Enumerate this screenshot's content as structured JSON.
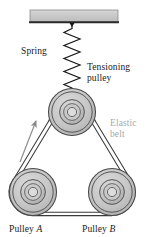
{
  "figure": {
    "background": "#ffffff",
    "width": 148,
    "height": 237
  },
  "labels": {
    "spring": "Spring",
    "tensioning_pulley_line1": "Tensioning",
    "tensioning_pulley_line2": "pulley",
    "elastic_belt_line1": "Elastic",
    "elastic_belt_line2": "belt",
    "pulley_a_word": "Pulley",
    "pulley_a_letter": "A",
    "pulley_b_word": "Pulley",
    "pulley_b_letter": "B"
  },
  "colors": {
    "line": "#1a1a1a",
    "ceiling_fill": "#c8c8c8",
    "ceiling_edge": "#2b2b2b",
    "pulley_outer": "#bdbdbd",
    "pulley_mid": "#cfcfcf",
    "pulley_hub": "#b5b5b5",
    "pulley_stroke": "#555555",
    "belt": "#3a3a3a",
    "elastic_text": "#a8a8a8",
    "arrow": "#8a8a8a"
  },
  "geometry": {
    "ceiling": {
      "x": 30,
      "y": 10,
      "width": 88,
      "height": 12
    },
    "anchor_point": {
      "x": 72,
      "y": 23
    },
    "spring": {
      "x": 72,
      "top": 24,
      "bottom": 88,
      "coils": 9,
      "amplitude": 8
    },
    "pulleys": [
      {
        "name": "tensioning-pulley",
        "cx": 72,
        "cy": 112,
        "r_outer": 24
      },
      {
        "name": "pulley-a",
        "cx": 33,
        "cy": 192,
        "r_outer": 24
      },
      {
        "name": "pulley-b",
        "cx": 112,
        "cy": 192,
        "r_outer": 24
      }
    ],
    "direction_arrow": {
      "x1": 20,
      "y1": 162,
      "x2": 36,
      "y2": 121
    }
  }
}
